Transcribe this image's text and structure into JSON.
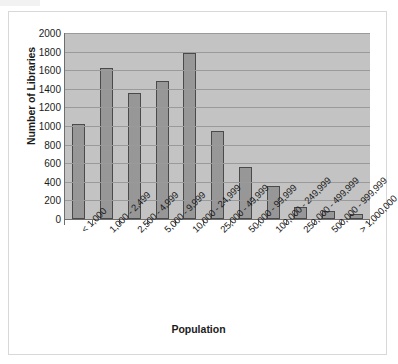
{
  "chart_data": {
    "type": "bar",
    "title": "",
    "xlabel": "Population",
    "ylabel": "Number of Libraries",
    "categories": [
      "< 1,000",
      "1,000 - 2,499",
      "2,500 - 4,999",
      "5,000 - 9,999",
      "10,000 - 24,999",
      "25,000 - 49,999",
      "50,000 - 99,999",
      "100,000 - 249,999",
      "250,000 - 499,999",
      "500,000 - 999,999",
      "> 1,000,000"
    ],
    "values": [
      1020,
      1620,
      1350,
      1480,
      1790,
      945,
      560,
      355,
      125,
      85,
      50
    ],
    "ylim": [
      0,
      2000
    ],
    "ytick_labels": [
      "2000",
      "1800",
      "1600",
      "1400",
      "1200",
      "1000",
      "800",
      "600",
      "400",
      "200",
      "0"
    ],
    "ytick_values": [
      2000,
      1800,
      1600,
      1400,
      1200,
      1000,
      800,
      600,
      400,
      200,
      0
    ],
    "ytick_step": 200,
    "grid": true,
    "legend": false,
    "colors": {
      "bar_fill": "#979797",
      "bar_border": "#4a4a4a",
      "plot_background": "#c3c3c3",
      "gridline": "#9a9a9a",
      "axis_line": "#6e6e6e",
      "text": "#1b1b1b",
      "page_background": "#ffffff",
      "frame_border": "#d8d8d8"
    }
  }
}
